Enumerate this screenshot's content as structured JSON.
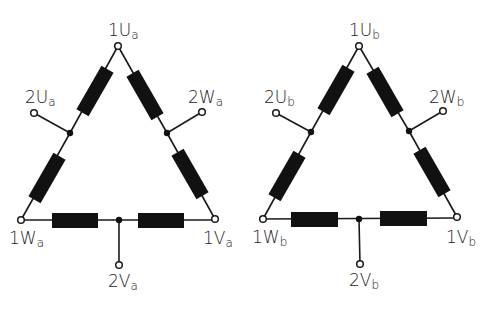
{
  "figure": {
    "colors": {
      "ink": "#111111",
      "background": "#ffffff"
    },
    "triangles": [
      {
        "id": "a",
        "subscript": "a",
        "labels": {
          "top": {
            "main": "1U",
            "sub": "a"
          },
          "left_tap": {
            "main": "2U",
            "sub": "a"
          },
          "right_tap": {
            "main": "2W",
            "sub": "a"
          },
          "bottom_left": {
            "main": "1W",
            "sub": "a"
          },
          "bottom_right": {
            "main": "1V",
            "sub": "a"
          },
          "bottom_tap": {
            "main": "2V",
            "sub": "a"
          }
        }
      },
      {
        "id": "b",
        "subscript": "b",
        "labels": {
          "top": {
            "main": "1U",
            "sub": "b"
          },
          "left_tap": {
            "main": "2U",
            "sub": "b"
          },
          "right_tap": {
            "main": "2W",
            "sub": "b"
          },
          "bottom_left": {
            "main": "1W",
            "sub": "b"
          },
          "bottom_right": {
            "main": "1V",
            "sub": "b"
          },
          "bottom_tap": {
            "main": "2V",
            "sub": "b"
          }
        }
      }
    ]
  }
}
